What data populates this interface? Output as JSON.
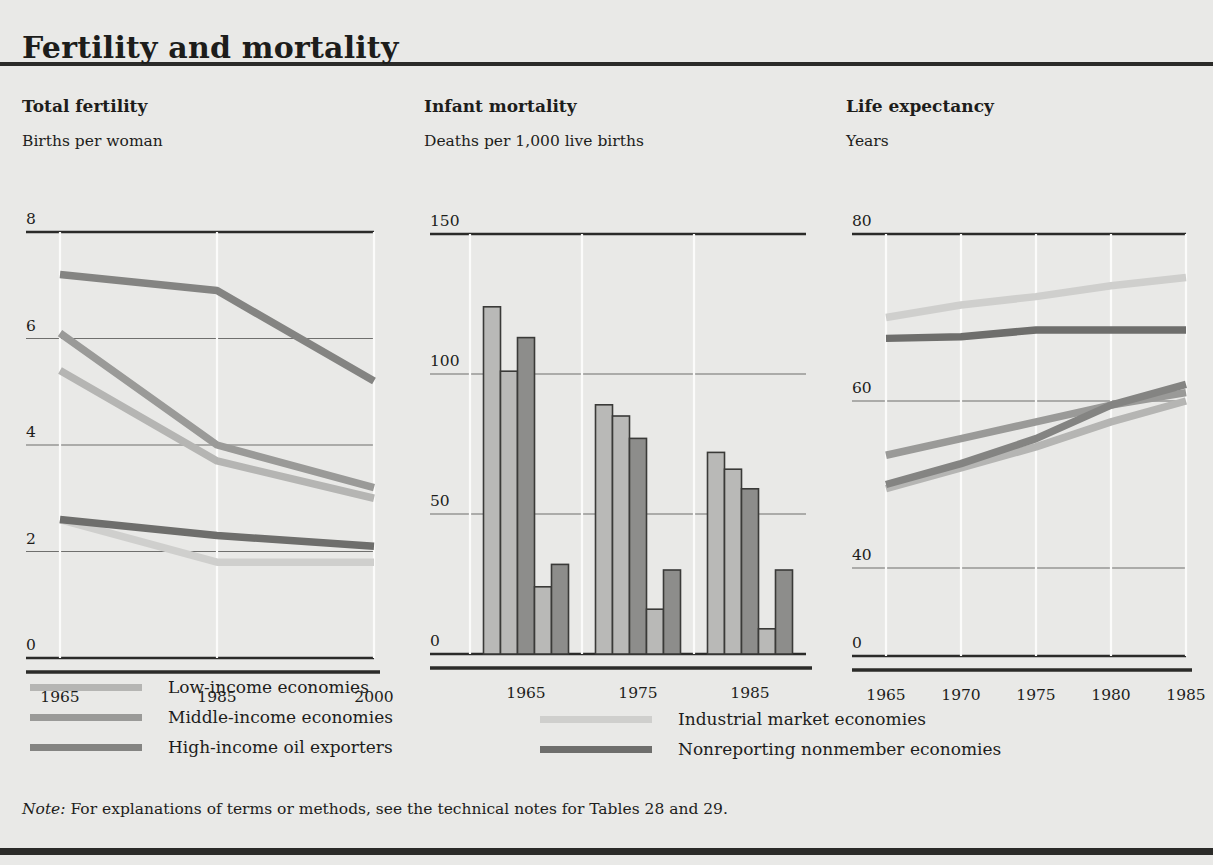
{
  "figure": {
    "title": "Fertility and mortality",
    "note_prefix": "Note:",
    "note_text": " For explanations of terms or methods, see the technical notes for Tables 28 and 29."
  },
  "colors": {
    "low_income": "#b5b5b3",
    "middle_income": "#9a9a98",
    "high_income_oil": "#848482",
    "industrial_market": "#cfcfcd",
    "nonreporting": "#6e6e6c",
    "gridline": "#6f6f6d",
    "axis": "#2b2b29",
    "panel_background": "#e9e9e7",
    "bar_light": "#b9b9b7",
    "bar_dark": "#8d8d8b",
    "bar_outline": "#3a3a38"
  },
  "legend": {
    "left_column": [
      {
        "label": "Low-income economies",
        "color_key": "low_income"
      },
      {
        "label": "Middle-income economies",
        "color_key": "middle_income"
      },
      {
        "label": "High-income oil exporters",
        "color_key": "high_income_oil"
      }
    ],
    "right_column": [
      {
        "label": "Industrial market economies",
        "color_key": "industrial_market"
      },
      {
        "label": "Nonreporting nonmember economies",
        "color_key": "nonreporting"
      }
    ]
  },
  "chart_data": [
    {
      "type": "line",
      "title": "Total fertility",
      "subtitle": "Births per woman",
      "ylabel": "Births per woman",
      "xlabel": "",
      "x": [
        1965,
        1985,
        2000
      ],
      "xticks": [
        "1965",
        "1985",
        "2000"
      ],
      "yticks": [
        0,
        2,
        4,
        6,
        8
      ],
      "ytick_labels": [
        "0",
        "2",
        "4",
        "6",
        "8"
      ],
      "ylim": [
        0,
        8
      ],
      "grid": true,
      "legend_position": "below-figure",
      "series": [
        {
          "name": "Low-income economies",
          "values": [
            5.4,
            3.7,
            3.0
          ]
        },
        {
          "name": "Middle-income economies",
          "values": [
            6.1,
            4.0,
            3.2
          ]
        },
        {
          "name": "High-income oil exporters",
          "values": [
            7.2,
            6.9,
            5.2
          ]
        },
        {
          "name": "Industrial market economies",
          "values": [
            2.6,
            1.8,
            1.8
          ]
        },
        {
          "name": "Nonreporting nonmember economies",
          "values": [
            2.6,
            2.3,
            2.1
          ]
        }
      ]
    },
    {
      "type": "bar",
      "title": "Infant mortality",
      "subtitle": "Deaths per 1,000 live births",
      "ylabel": "Deaths per 1,000 live births",
      "xlabel": "",
      "categories": [
        "1965",
        "1975",
        "1985"
      ],
      "xticks": [
        "1965",
        "1975",
        "1985"
      ],
      "yticks": [
        0,
        50,
        100,
        150
      ],
      "ytick_labels": [
        "0",
        "50",
        "100",
        "150"
      ],
      "ylim": [
        0,
        150
      ],
      "grid": true,
      "legend_position": "below-figure",
      "series": [
        {
          "name": "Low-income economies",
          "values": [
            124,
            89,
            72
          ]
        },
        {
          "name": "Middle-income economies",
          "values": [
            101,
            85,
            66
          ]
        },
        {
          "name": "High-income oil exporters",
          "values": [
            113,
            77,
            59
          ]
        },
        {
          "name": "Industrial market economies",
          "values": [
            24,
            16,
            9
          ]
        },
        {
          "name": "Nonreporting nonmember economies",
          "values": [
            32,
            30,
            30
          ]
        }
      ]
    },
    {
      "type": "line",
      "title": "Life expectancy",
      "subtitle": "Years",
      "ylabel": "Years",
      "xlabel": "",
      "x": [
        1965,
        1970,
        1975,
        1980,
        1985
      ],
      "xticks": [
        "1965",
        "1970",
        "1975",
        "1980",
        "1985"
      ],
      "yticks": [
        0,
        40,
        60,
        80
      ],
      "ytick_labels": [
        "0",
        "40",
        "60",
        "80"
      ],
      "ylim": [
        0,
        80
      ],
      "axis_break_between": [
        0,
        40
      ],
      "grid": true,
      "legend_position": "below-figure",
      "series": [
        {
          "name": "Low-income economies",
          "values": [
            49.5,
            52.0,
            54.5,
            57.5,
            60.0
          ]
        },
        {
          "name": "Middle-income economies",
          "values": [
            53.5,
            55.5,
            57.5,
            59.5,
            61.0
          ]
        },
        {
          "name": "High-income oil exporters",
          "values": [
            50.0,
            52.5,
            55.5,
            59.5,
            62.0
          ]
        },
        {
          "name": "Industrial market economies",
          "values": [
            70.0,
            71.5,
            72.5,
            73.8,
            74.8
          ]
        },
        {
          "name": "Nonreporting nonmember economies",
          "values": [
            67.5,
            67.7,
            68.5,
            68.5,
            68.5
          ]
        }
      ]
    }
  ]
}
